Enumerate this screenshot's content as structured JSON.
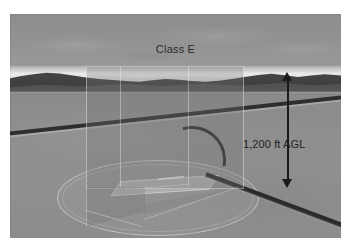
{
  "figure": {
    "type": "aviation-airspace-illustration",
    "caption_remnant": "",
    "labels": {
      "airspace_class": "Class E",
      "altitude": "1,200 ft AGL"
    },
    "scene": {
      "sky": "overcast gray sky",
      "terrain": "forested mountain ridgeline on horizon",
      "ground": "flat valley floor",
      "road": "highway curving across the valley",
      "airport": "runway inside circular airspace footprint"
    },
    "annotations": {
      "airspace_box_name": "class-e-airspace-volume",
      "dimension_arrow_name": "altitude-dimension-arrow"
    },
    "colors": {
      "sky": "#8f8f8f",
      "haze": "#e8e8e8",
      "mountains": "#454545",
      "ground": "#8e8e8e",
      "road": "#2e2e2e",
      "airspace_tint": "rgba(120,120,120,0.30)",
      "arrow": "#1a1a1a",
      "label_text": "#2b2b2b",
      "page_background": "#ffffff"
    }
  }
}
